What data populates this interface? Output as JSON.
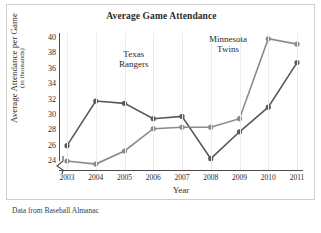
{
  "chart_data": {
    "type": "line",
    "title": "Average Game Attendance",
    "xlabel": "Year",
    "ylabel": "Average Attendance per Game",
    "ylabel_sub": "(in thousands)",
    "categories": [
      "2003",
      "2004",
      "2005",
      "2006",
      "2007",
      "2008",
      "2009",
      "2010",
      "2011"
    ],
    "x": [
      2003,
      2004,
      2005,
      2006,
      2007,
      2008,
      2009,
      2010,
      2011
    ],
    "ylim": [
      24,
      40
    ],
    "yticks": [
      24,
      26,
      28,
      30,
      32,
      34,
      36,
      38,
      40
    ],
    "grid": "vertical",
    "legend": "inline-annotations",
    "axis_break": true,
    "series": [
      {
        "name": "Texas Rangers",
        "color": "#595959",
        "values": [
          26.0,
          31.8,
          31.5,
          29.5,
          29.8,
          24.3,
          27.8,
          31.0,
          36.8
        ]
      },
      {
        "name": "Minnesota Twins",
        "color": "#8a8a8a",
        "values": [
          24.0,
          23.6,
          25.3,
          28.2,
          28.4,
          28.4,
          29.5,
          39.9,
          39.2
        ]
      }
    ],
    "annotations": [
      {
        "text": "Texas",
        "text2": "Rangers",
        "series": "Texas Rangers"
      },
      {
        "text": "Minnesota",
        "text2": "Twins",
        "series": "Minnesota Twins"
      }
    ],
    "source_note": "Data from Baseball Almanac"
  }
}
